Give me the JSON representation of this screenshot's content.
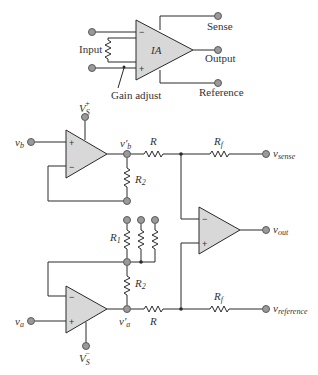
{
  "top_block": {
    "amp_label": "IA",
    "input_label": "Input",
    "gain_label": "Gain adjust",
    "sense_label": "Sense",
    "output_label": "Output",
    "reference_label": "Reference",
    "minus": "−",
    "plus": "+"
  },
  "circuit": {
    "vs_plus": "V",
    "vs_plus_sub": "S",
    "vs_plus_sup": "+",
    "vs_minus": "V",
    "vs_minus_sub": "S",
    "vs_minus_sup": "−",
    "vb": "v",
    "vb_sub": "b",
    "va": "v",
    "va_sub": "a",
    "vb_prime": "v′",
    "vb_prime_sub": "b",
    "va_prime": "v′",
    "va_prime_sub": "a",
    "R_top": "R",
    "R_bottom": "R",
    "Rf": "R",
    "Rf_sub": "f",
    "Rf2": "R",
    "Rf2_sub": "f",
    "R2_top": "R",
    "R2_top_sub": "2",
    "R2_bot": "R",
    "R2_bot_sub": "2",
    "R1": "R",
    "R1_sub": "1",
    "v_sense": "v",
    "v_sense_sub": "sense",
    "v_out": "v",
    "v_out_sub": "out",
    "v_ref": "v",
    "v_ref_sub": "reference",
    "minus": "−",
    "plus": "+"
  }
}
